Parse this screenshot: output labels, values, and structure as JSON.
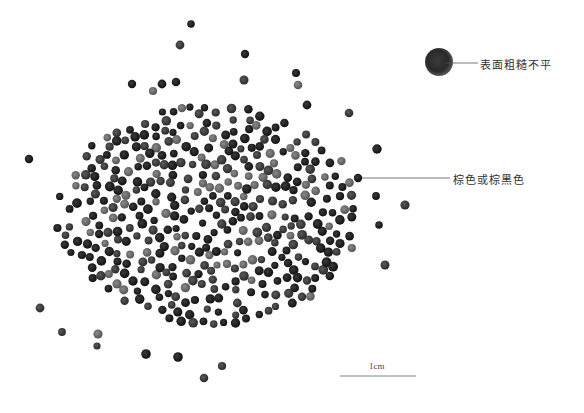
{
  "annotations": {
    "surface": "表面粗糙不平",
    "color": "棕色或棕黑色"
  },
  "scale_bar": {
    "label": "1cm"
  },
  "colors": {
    "seed_dark": "#1e1e1e",
    "seed_mid": "#3a3a3a",
    "seed_light": "#6a6a6a",
    "leader_line": "#555555",
    "background": "#ffffff"
  }
}
